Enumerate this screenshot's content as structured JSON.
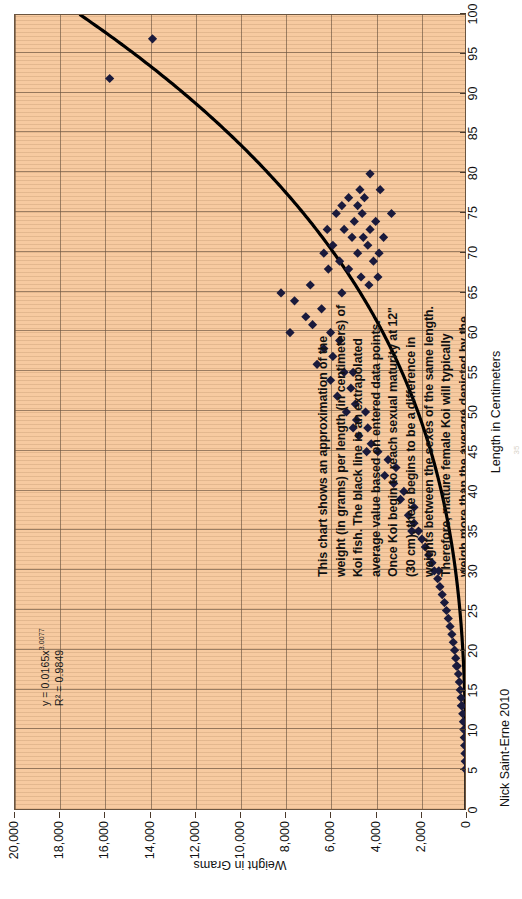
{
  "chart_data": {
    "type": "scatter",
    "title": "",
    "xlabel": "Length in Centimeters",
    "ylabel": "Weight in Grams",
    "xlim": [
      0,
      100
    ],
    "ylim": [
      0,
      20000
    ],
    "xticks": [
      0,
      5,
      10,
      15,
      20,
      25,
      30,
      35,
      40,
      45,
      50,
      55,
      60,
      65,
      70,
      75,
      80,
      85,
      90,
      95,
      100
    ],
    "xtick_labels": [
      "0",
      "5",
      "10",
      "15",
      "20",
      "25",
      "30",
      "35",
      "40",
      "45",
      "50",
      "55",
      "60",
      "65",
      "70",
      "75",
      "80",
      "85",
      "90",
      "95",
      "100"
    ],
    "yticks": [
      0,
      2000,
      4000,
      6000,
      8000,
      10000,
      12000,
      14000,
      16000,
      18000,
      20000
    ],
    "ytick_labels": [
      "0",
      "2,000",
      "4,000",
      "6,000",
      "8,000",
      "10,000",
      "12,000",
      "14,000",
      "16,000",
      "18,000",
      "20,000"
    ],
    "grid": true,
    "legend": "none",
    "marker": "diamond",
    "marker_color": "#1a1a3c",
    "trendline": {
      "type": "power",
      "coefficient": 0.0165,
      "exponent": 3.0077,
      "equation": "y = 0.0165x",
      "equation_exponent": "3.0077",
      "r_squared_label": "R² = 0.9849",
      "r_squared": 0.9849,
      "color": "#000000"
    },
    "points": [
      [
        5,
        20
      ],
      [
        6,
        30
      ],
      [
        7,
        40
      ],
      [
        8,
        55
      ],
      [
        9,
        70
      ],
      [
        10,
        90
      ],
      [
        11,
        110
      ],
      [
        12,
        140
      ],
      [
        13,
        170
      ],
      [
        13,
        200
      ],
      [
        14,
        210
      ],
      [
        15,
        250
      ],
      [
        16,
        290
      ],
      [
        17,
        330
      ],
      [
        18,
        380
      ],
      [
        18,
        420
      ],
      [
        19,
        450
      ],
      [
        20,
        500
      ],
      [
        21,
        560
      ],
      [
        22,
        620
      ],
      [
        23,
        700
      ],
      [
        24,
        780
      ],
      [
        25,
        860
      ],
      [
        26,
        950
      ],
      [
        27,
        1050
      ],
      [
        28,
        1150
      ],
      [
        29,
        1250
      ],
      [
        30,
        1400
      ],
      [
        30,
        1200
      ],
      [
        31,
        1500
      ],
      [
        32,
        1650
      ],
      [
        33,
        1800
      ],
      [
        34,
        1950
      ],
      [
        35,
        2100
      ],
      [
        35,
        2400
      ],
      [
        36,
        2300
      ],
      [
        37,
        2550
      ],
      [
        38,
        2300
      ],
      [
        39,
        2900
      ],
      [
        40,
        2750
      ],
      [
        41,
        3200
      ],
      [
        42,
        3600
      ],
      [
        43,
        3100
      ],
      [
        44,
        3450
      ],
      [
        45,
        4400
      ],
      [
        45,
        3900
      ],
      [
        46,
        4200
      ],
      [
        47,
        4750
      ],
      [
        48,
        5000
      ],
      [
        48,
        4350
      ],
      [
        49,
        4850
      ],
      [
        50,
        4450
      ],
      [
        50,
        5300
      ],
      [
        51,
        4900
      ],
      [
        52,
        5700
      ],
      [
        53,
        5100
      ],
      [
        54,
        6000
      ],
      [
        55,
        5400
      ],
      [
        55,
        5000
      ],
      [
        56,
        6600
      ],
      [
        57,
        5900
      ],
      [
        58,
        6300
      ],
      [
        59,
        5600
      ],
      [
        60,
        7800
      ],
      [
        60,
        6000
      ],
      [
        61,
        6800
      ],
      [
        62,
        7100
      ],
      [
        63,
        6400
      ],
      [
        64,
        7600
      ],
      [
        65,
        8200
      ],
      [
        65,
        5500
      ],
      [
        66,
        4300
      ],
      [
        66,
        6900
      ],
      [
        67,
        3900
      ],
      [
        67,
        4650
      ],
      [
        68,
        5200
      ],
      [
        68,
        6100
      ],
      [
        69,
        4100
      ],
      [
        69,
        5600
      ],
      [
        70,
        3850
      ],
      [
        70,
        4800
      ],
      [
        70,
        6300
      ],
      [
        71,
        4350
      ],
      [
        71,
        5900
      ],
      [
        72,
        3650
      ],
      [
        72,
        4550
      ],
      [
        72,
        5050
      ],
      [
        73,
        4250
      ],
      [
        73,
        5400
      ],
      [
        73,
        6150
      ],
      [
        74,
        4000
      ],
      [
        74,
        4950
      ],
      [
        75,
        3300
      ],
      [
        75,
        4600
      ],
      [
        75,
        5750
      ],
      [
        76,
        4800
      ],
      [
        76,
        5500
      ],
      [
        77,
        4500
      ],
      [
        77,
        5200
      ],
      [
        78,
        3800
      ],
      [
        78,
        4700
      ],
      [
        80,
        4250
      ],
      [
        92,
        15800
      ],
      [
        97,
        13900
      ]
    ]
  },
  "annotation": {
    "lines": [
      "This chart shows an approximation of the",
      "weight (in grams) per length (in centimeters) of",
      "Koi fish.  The black line is an extrapolated",
      "average value based on entered data points.",
      "Once Koi begin to reach sexual maturity at 12\"",
      "(30 cm), there begins to be a difference in",
      "weights between the sexes of the same length.",
      "Therefore, mature female Koi will typically",
      "weigh more than the average depicted by the",
      "black line, and males will weigh less than the",
      "average value for each length."
    ]
  },
  "attribution": {
    "text": "Nick Saint-Erne 2010"
  },
  "page": {
    "number": "35"
  },
  "colors": {
    "plot_background": "#f7caa0",
    "grid": "#6b5540",
    "marker": "#1a1a3c",
    "trendline": "#000000",
    "text": "#111111"
  }
}
